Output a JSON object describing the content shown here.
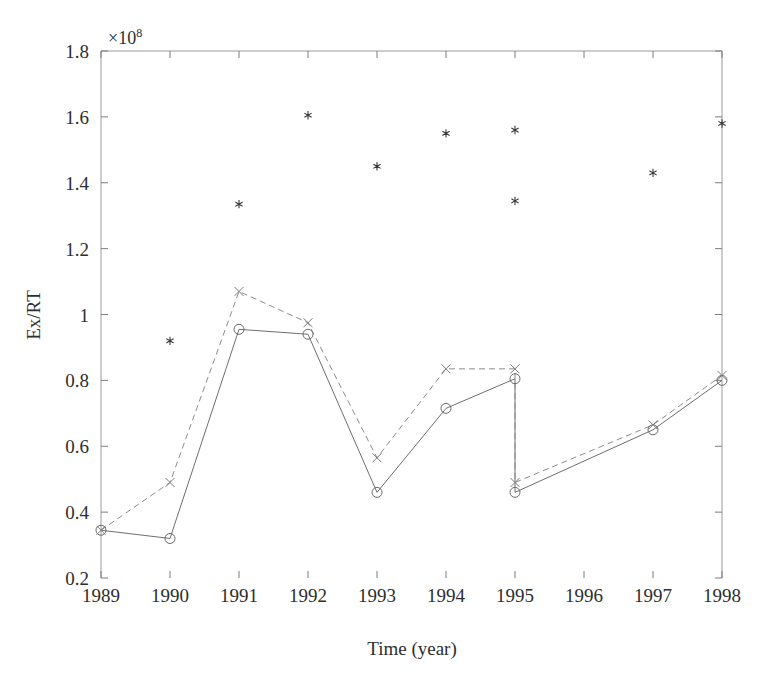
{
  "chart_data": {
    "type": "line",
    "title": "",
    "xlabel": "Time (year)",
    "ylabel": "Ex/RT",
    "y_exponent_label": "×10",
    "y_exponent_power": "8",
    "xlim": [
      1989,
      1998
    ],
    "ylim": [
      0.2,
      1.8
    ],
    "grid": false,
    "legend": "none",
    "x_tick_labels": [
      "1989",
      "1990",
      "1991",
      "1992",
      "1993",
      "1994",
      "1995",
      "1996",
      "1997",
      "1998"
    ],
    "x_ticks": [
      1989,
      1990,
      1991,
      1992,
      1993,
      1994,
      1995,
      1996,
      1997,
      1998
    ],
    "y_tick_labels": [
      "0.2",
      "0.4",
      "0.6",
      "0.8",
      "1",
      "1.2",
      "1.4",
      "1.6",
      "1.8"
    ],
    "y_ticks": [
      0.2,
      0.4,
      0.6,
      0.8,
      1.0,
      1.2,
      1.4,
      1.6,
      1.8
    ],
    "series": [
      {
        "name": "solid-circle-series",
        "marker": "circle",
        "linestyle": "solid",
        "color": "#6e6e6e",
        "x": [
          1989,
          1990,
          1991,
          1992,
          1993,
          1994,
          1995,
          1995,
          1997,
          1998
        ],
        "values": [
          0.345,
          0.32,
          0.955,
          0.94,
          0.46,
          0.715,
          0.805,
          0.46,
          0.65,
          0.8
        ]
      },
      {
        "name": "dashed-x-series",
        "marker": "x",
        "linestyle": "dashed",
        "color": "#8c8c8c",
        "x": [
          1989,
          1990,
          1991,
          1992,
          1993,
          1994,
          1995,
          1995,
          1997,
          1998
        ],
        "values": [
          0.345,
          0.49,
          1.07,
          0.975,
          0.565,
          0.835,
          0.835,
          0.49,
          0.665,
          0.815
        ]
      },
      {
        "name": "star-scatter-series",
        "marker": "star",
        "linestyle": "none",
        "color": "#3a3a3a",
        "x": [
          1990,
          1991,
          1992,
          1993,
          1994,
          1995,
          1995,
          1997,
          1998
        ],
        "values": [
          0.92,
          1.335,
          1.605,
          1.45,
          1.55,
          1.56,
          1.345,
          1.43,
          1.58
        ]
      }
    ]
  },
  "figure": {
    "axis_color": "#9a9a9a",
    "background": "#ffffff",
    "plot_left_px": 101,
    "plot_right_px": 722,
    "plot_top_px": 51,
    "plot_bottom_px": 578
  }
}
